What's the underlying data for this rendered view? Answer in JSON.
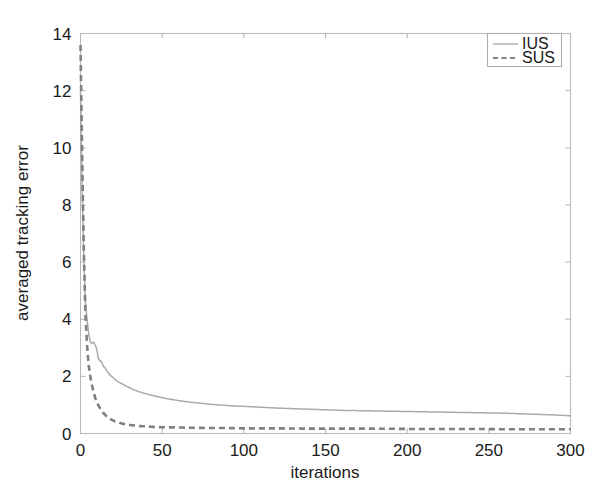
{
  "chart_data": {
    "type": "line",
    "title": "",
    "subtitle": "",
    "xlabel": "iterations",
    "ylabel": "averaged tracking error",
    "xlim": [
      0,
      300
    ],
    "ylim": [
      0,
      14
    ],
    "xticks": [
      0,
      50,
      100,
      150,
      200,
      250,
      300
    ],
    "xtick_labels": [
      "0",
      "50",
      "100",
      "150",
      "200",
      "250",
      "300"
    ],
    "yticks": [
      0,
      2,
      4,
      6,
      8,
      10,
      12,
      14
    ],
    "ytick_labels": [
      "0",
      "2",
      "4",
      "6",
      "8",
      "10",
      "12",
      "14"
    ],
    "grid": false,
    "legend_position": "top-right",
    "legend_entries": [
      {
        "label": "IUS",
        "style": "solid",
        "color": "#aaaaaa"
      },
      {
        "label": "SUS",
        "style": "dashed",
        "color": "#808080"
      }
    ],
    "series": [
      {
        "name": "IUS",
        "style": "solid",
        "color": "#aaaaaa",
        "x": [
          0,
          1,
          2,
          3,
          4,
          5,
          6,
          7,
          8,
          9,
          10,
          11,
          12,
          13,
          14,
          15,
          16,
          18,
          20,
          22,
          24,
          26,
          28,
          30,
          33,
          36,
          39,
          42,
          45,
          48,
          51,
          55,
          60,
          65,
          70,
          75,
          80,
          85,
          90,
          95,
          100,
          110,
          120,
          130,
          140,
          150,
          160,
          170,
          180,
          190,
          200,
          210,
          220,
          230,
          240,
          250,
          260,
          270,
          280,
          290,
          300
        ],
        "y": [
          12.0,
          8.6,
          6.2,
          4.6,
          4.0,
          3.5,
          3.2,
          3.15,
          3.2,
          3.1,
          2.95,
          2.6,
          2.55,
          2.5,
          2.35,
          2.3,
          2.2,
          2.05,
          1.95,
          1.85,
          1.78,
          1.72,
          1.66,
          1.6,
          1.52,
          1.46,
          1.41,
          1.36,
          1.32,
          1.28,
          1.24,
          1.2,
          1.15,
          1.11,
          1.08,
          1.05,
          1.02,
          1.0,
          0.98,
          0.96,
          0.95,
          0.92,
          0.89,
          0.87,
          0.85,
          0.83,
          0.81,
          0.8,
          0.79,
          0.78,
          0.77,
          0.76,
          0.75,
          0.74,
          0.73,
          0.72,
          0.71,
          0.69,
          0.67,
          0.65,
          0.62
        ]
      },
      {
        "name": "SUS",
        "style": "dashed",
        "color": "#808080",
        "x": [
          0,
          1,
          2,
          3,
          4,
          5,
          6,
          7,
          8,
          9,
          10,
          11,
          12,
          13,
          14,
          15,
          16,
          18,
          20,
          22,
          24,
          26,
          28,
          30,
          33,
          36,
          40,
          45,
          50,
          60,
          70,
          80,
          90,
          100,
          120,
          140,
          160,
          180,
          200,
          220,
          240,
          260,
          280,
          300
        ],
        "y": [
          13.6,
          9.8,
          6.5,
          4.2,
          3.1,
          2.4,
          2.0,
          1.7,
          1.45,
          1.25,
          1.1,
          0.98,
          0.88,
          0.8,
          0.72,
          0.66,
          0.6,
          0.52,
          0.45,
          0.41,
          0.37,
          0.34,
          0.32,
          0.3,
          0.28,
          0.26,
          0.25,
          0.23,
          0.22,
          0.21,
          0.2,
          0.19,
          0.19,
          0.18,
          0.18,
          0.17,
          0.17,
          0.17,
          0.16,
          0.16,
          0.16,
          0.15,
          0.15,
          0.15
        ]
      }
    ]
  },
  "axes": {
    "x_title": "iterations",
    "y_title": "averaged tracking error"
  },
  "legend": {
    "items": [
      {
        "label": "IUS"
      },
      {
        "label": "SUS"
      }
    ]
  }
}
